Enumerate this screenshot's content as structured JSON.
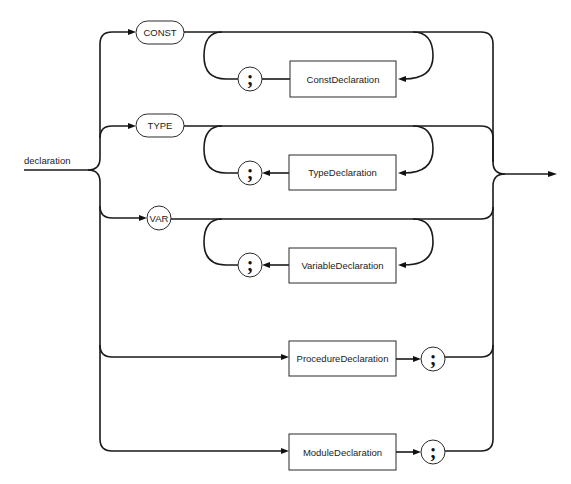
{
  "diagram": {
    "type": "syntax-diagram",
    "production": "declaration",
    "branches": [
      {
        "keyword": "CONST",
        "keyword_shape": "pill",
        "body": "ConstDeclaration",
        "repeat_separator": ";",
        "repeatable": true
      },
      {
        "keyword": "TYPE",
        "keyword_shape": "pill",
        "body": "TypeDeclaration",
        "repeat_separator": ";",
        "repeatable": true
      },
      {
        "keyword": "VAR",
        "keyword_shape": "circle",
        "body": "VariableDeclaration",
        "repeat_separator": ";",
        "repeatable": true
      },
      {
        "keyword": null,
        "body": "ProcedureDeclaration",
        "terminator": ";"
      },
      {
        "keyword": null,
        "body": "ModuleDeclaration",
        "terminator": ";"
      }
    ]
  },
  "labels": {
    "entry": "declaration",
    "const_kw": "CONST",
    "type_kw": "TYPE",
    "var_kw": "VAR",
    "const_decl": "ConstDeclaration",
    "type_decl": "TypeDeclaration",
    "var_decl": "VariableDeclaration",
    "proc_decl": "ProcedureDeclaration",
    "module_decl": "ModuleDeclaration",
    "semicolon": ";"
  }
}
